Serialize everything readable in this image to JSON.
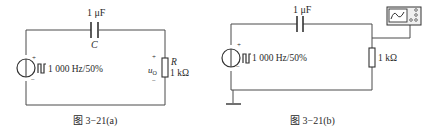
{
  "figure_a": {
    "capacitor_value": "1 μF",
    "capacitor_symbol": "C",
    "source_label": "1 000 Hz/50%",
    "source_plus": "+",
    "source_minus": "−",
    "output_plus": "+",
    "output_minus": "−",
    "output_voltage": "u",
    "output_voltage_sub": "O",
    "resistor_symbol": "R",
    "resistor_value": "1 kΩ",
    "caption": "图 3−21(a)"
  },
  "figure_b": {
    "capacitor_value": "1 μF",
    "source_label": "1 000 Hz/50%",
    "source_plus": "+",
    "source_minus": "−",
    "resistor_value": "1 kΩ",
    "instrument": "oscilloscope-icon",
    "caption": "图 3−21(b)"
  },
  "colors": {
    "wire": "#4a4a4a",
    "text": "#2a2a2a",
    "background": "#ffffff"
  }
}
